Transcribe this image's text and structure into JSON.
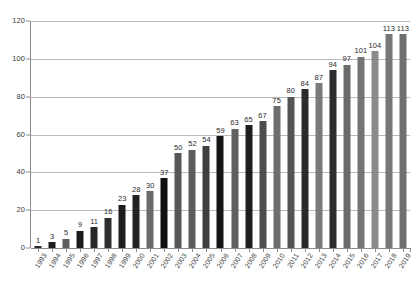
{
  "chart_data": {
    "type": "bar",
    "title": "",
    "subtitle": "",
    "xlabel": "",
    "ylabel": "",
    "categories": [
      "1993",
      "1994",
      "1995",
      "1996",
      "1997",
      "1998",
      "1999",
      "2000",
      "2001",
      "2002",
      "2003",
      "2004",
      "2005",
      "2006",
      "2007",
      "2008",
      "2009",
      "2010",
      "2011",
      "2012",
      "2013",
      "2014",
      "2015",
      "2016",
      "2017",
      "2018",
      "2019"
    ],
    "values": [
      1,
      3,
      5,
      9,
      11,
      16,
      23,
      28,
      30,
      37,
      50,
      52,
      54,
      59,
      63,
      65,
      67,
      75,
      80,
      84,
      87,
      94,
      97,
      101,
      104,
      113,
      113
    ],
    "bar_colors": [
      "#2b2b2b",
      "#1c1c1c",
      "#5e5e5e",
      "#1a1a1a",
      "#272727",
      "#2e2e2e",
      "#1d1d1d",
      "#232323",
      "#6a6a6a",
      "#101010",
      "#575757",
      "#5c5c5c",
      "#3f3f3f",
      "#151515",
      "#606060",
      "#1e1e1e",
      "#4d4d4d",
      "#6e6e6e",
      "#545454",
      "#2a2a2a",
      "#7a7a7a",
      "#2d2d2d",
      "#6b6b6b",
      "#757575",
      "#8a8a8a",
      "#777777",
      "#6f6f6f"
    ],
    "ylim": [
      0,
      120
    ],
    "y_ticks": [
      0,
      20,
      40,
      60,
      80,
      100,
      120
    ],
    "y_tick_labels": [
      "0",
      "20",
      "40",
      "60",
      "80",
      "100",
      "120"
    ],
    "grid": true,
    "grid_axis": "y",
    "legend": null,
    "legend_position": "none",
    "data_labels_shown": true,
    "axis_color": "#8c8c8c",
    "gridline_color": "#b9b9b9",
    "label_color": "#3a3a3a",
    "background_color": "#ffffff"
  }
}
